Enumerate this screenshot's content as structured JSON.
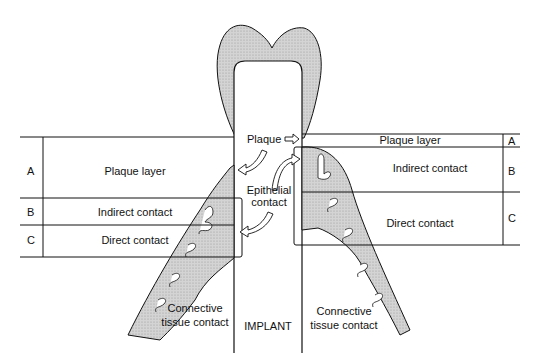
{
  "diagram": {
    "left_panel": {
      "rows": [
        {
          "letter": "A",
          "label": "Plaque layer"
        },
        {
          "letter": "B",
          "label": "Indirect contact"
        },
        {
          "letter": "C",
          "label": "Direct contact"
        }
      ]
    },
    "right_panel": {
      "rows": [
        {
          "letter": "A",
          "label": "Plaque layer"
        },
        {
          "letter": "B",
          "label": "Indirect contact"
        },
        {
          "letter": "C",
          "label": "Direct contact"
        }
      ]
    },
    "center_labels": {
      "plaque": "Plaque",
      "epithelial_line1": "Epithelial",
      "epithelial_line2": "contact",
      "implant": "IMPLANT"
    },
    "bottom_labels": {
      "left_line1": "Connective",
      "left_line2": "tissue contact",
      "right_line1": "Connective",
      "right_line2": "tissue contact"
    },
    "colors": {
      "line": "#111111",
      "tissue_fill": "#c8c8c8",
      "background": "#ffffff"
    }
  }
}
